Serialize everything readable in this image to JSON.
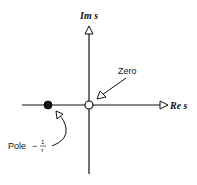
{
  "diagram": {
    "axes": {
      "imaginary_label": "Im s",
      "real_label": "Re s"
    },
    "zero": {
      "label": "Zero",
      "position": "origin",
      "style": "hollow circle"
    },
    "pole": {
      "label": "Pole",
      "value_sign": "−",
      "value_numerator": "1",
      "value_denominator": "τ",
      "style": "filled circle"
    },
    "colors": {
      "line": "#111111",
      "background": "#ffffff"
    }
  }
}
